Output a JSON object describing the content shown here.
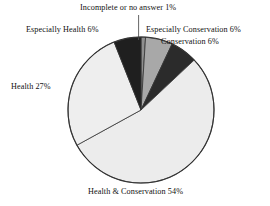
{
  "chart_data": {
    "type": "pie",
    "title": "",
    "subtitle": "",
    "xlabel": "",
    "ylabel": "",
    "legend_position": "none",
    "grid": false,
    "units": "percent",
    "total": 100,
    "start_angle_deg": 0,
    "direction": "clockwise",
    "categories": [
      "Incomplete or no answer",
      "Especially Conservation",
      "Conservation",
      "Health & Conservation",
      "Health",
      "Especially Health"
    ],
    "values": [
      1,
      6,
      6,
      54,
      27,
      6
    ],
    "slices": [
      {
        "name": "incomplete",
        "label": "Incomplete or no answer 1%",
        "category": "Incomplete or no answer",
        "value": 1,
        "color": "#8f8f8f",
        "start_deg": 0,
        "end_deg": 3.6
      },
      {
        "name": "especially-conservation",
        "label": "Especially Conservation 6%",
        "category": "Especially Conservation",
        "value": 6,
        "color": "#a8a8a8",
        "start_deg": 3.6,
        "end_deg": 25.2
      },
      {
        "name": "conservation",
        "label": "Conservation 6%",
        "category": "Conservation",
        "value": 6,
        "color": "#2b2b2b",
        "start_deg": 25.2,
        "end_deg": 46.8
      },
      {
        "name": "health-and-conservation",
        "label": "Health & Conservation 54%",
        "category": "Health & Conservation",
        "value": 54,
        "color": "#ececec",
        "start_deg": 46.8,
        "end_deg": 241.2
      },
      {
        "name": "health",
        "label": "Health 27%",
        "category": "Health",
        "value": 27,
        "color": "#eeeeee",
        "start_deg": 241.2,
        "end_deg": 338.4
      },
      {
        "name": "especially-health",
        "label": "Especially Health 6%",
        "category": "Especially Health",
        "value": 6,
        "color": "#1f1f1f",
        "start_deg": 338.4,
        "end_deg": 360
      }
    ]
  },
  "labels": {
    "incomplete": "Incomplete or no answer 1%",
    "especially_conservation": "Especially Conservation 6%",
    "conservation": "Conservation 6%",
    "especially_health": "Especially Health 6%",
    "health": "Health 27%",
    "health_and_conservation": "Health & Conservation 54%"
  },
  "style": {
    "background": "#ffffff",
    "outline": "#333333",
    "text": "#111111",
    "leader_line": "#555555"
  }
}
